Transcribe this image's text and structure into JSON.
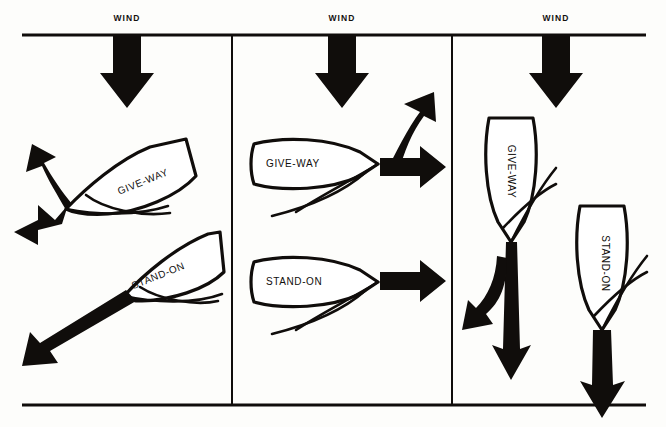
{
  "figure": {
    "background_color": "#fdfdfb",
    "ink_color": "#100d0b",
    "panel_count": 3
  },
  "frame": {
    "top_rule": {
      "x1": 22,
      "y1": 35,
      "x2": 646,
      "y2": 35,
      "width": 2.6
    },
    "bottom_rule": {
      "x1": 22,
      "y1": 405,
      "x2": 646,
      "y2": 405,
      "width": 2.6
    },
    "dividers": [
      {
        "x": 232,
        "y1": 35,
        "y2": 405,
        "width": 2.0
      },
      {
        "x": 452,
        "y1": 35,
        "y2": 405,
        "width": 2.0
      }
    ]
  },
  "panels": [
    {
      "id": "panel-beating",
      "index": 1,
      "point_of_sail": "close-hauled / beating",
      "wind": {
        "label": "WIND",
        "label_x": 127,
        "label_y": 15,
        "direction": "down"
      },
      "wind_arrow": {
        "x": 127,
        "top": 37,
        "shaft_half_width": 14,
        "head_half_width": 27,
        "head_top": 72,
        "tip_y": 108
      },
      "boats": [
        {
          "role": "GIVE-WAY",
          "label": "GIVE-WAY",
          "label_x": 148,
          "label_y": 182,
          "label_rotation": -22,
          "heading": "port tack, close-hauled",
          "arrows": [
            {
              "name": "curved-course-arrow",
              "direction": "up-left",
              "style": "curved"
            },
            {
              "name": "straight-course-arrow",
              "direction": "down-left",
              "style": "straight"
            }
          ]
        },
        {
          "role": "STAND-ON",
          "label": "STAND-ON",
          "label_x": 164,
          "label_y": 276,
          "label_rotation": -22,
          "heading": "port tack, close-hauled",
          "arrows": [
            {
              "name": "straight-course-arrow",
              "direction": "down-left",
              "style": "straight"
            }
          ]
        }
      ]
    },
    {
      "id": "panel-reaching",
      "index": 2,
      "point_of_sail": "beam reach",
      "wind": {
        "label": "WIND",
        "label_x": 342,
        "label_y": 15,
        "direction": "down"
      },
      "wind_arrow": {
        "x": 342,
        "top": 37,
        "shaft_half_width": 14,
        "head_half_width": 27,
        "head_top": 72,
        "tip_y": 108
      },
      "boats": [
        {
          "role": "GIVE-WAY",
          "label": "GIVE-WAY",
          "label_x": 291,
          "label_y": 164,
          "label_rotation": 0,
          "heading": "reaching to starboard",
          "arrows": [
            {
              "name": "curved-course-arrow",
              "direction": "up-right",
              "style": "curved"
            },
            {
              "name": "straight-course-arrow",
              "direction": "right",
              "style": "straight"
            }
          ]
        },
        {
          "role": "STAND-ON",
          "label": "STAND-ON",
          "label_x": 293,
          "label_y": 282,
          "label_rotation": 0,
          "heading": "reaching to starboard",
          "arrows": [
            {
              "name": "straight-course-arrow",
              "direction": "right",
              "style": "straight"
            }
          ]
        }
      ]
    },
    {
      "id": "panel-running",
      "index": 3,
      "point_of_sail": "running before the wind",
      "wind": {
        "label": "WIND",
        "label_x": 556,
        "label_y": 15,
        "direction": "down"
      },
      "wind_arrow": {
        "x": 556,
        "top": 37,
        "shaft_half_width": 14,
        "head_half_width": 27,
        "head_top": 72,
        "tip_y": 108
      },
      "boats": [
        {
          "role": "GIVE-WAY",
          "label": "GIVE-WAY",
          "label_x": 508,
          "label_y": 172,
          "label_rotation": 90,
          "heading": "running downwind",
          "arrows": [
            {
              "name": "curved-course-arrow",
              "direction": "down-left",
              "style": "curved"
            },
            {
              "name": "straight-course-arrow",
              "direction": "down",
              "style": "straight"
            }
          ]
        },
        {
          "role": "STAND-ON",
          "label": "STAND-ON",
          "label_x": 600,
          "label_y": 264,
          "label_rotation": 90,
          "heading": "running downwind",
          "arrows": [
            {
              "name": "straight-course-arrow",
              "direction": "down",
              "style": "straight"
            }
          ]
        }
      ]
    }
  ],
  "legend_terms": {
    "give_way": "GIVE-WAY",
    "stand_on": "STAND-ON",
    "wind": "WIND"
  }
}
